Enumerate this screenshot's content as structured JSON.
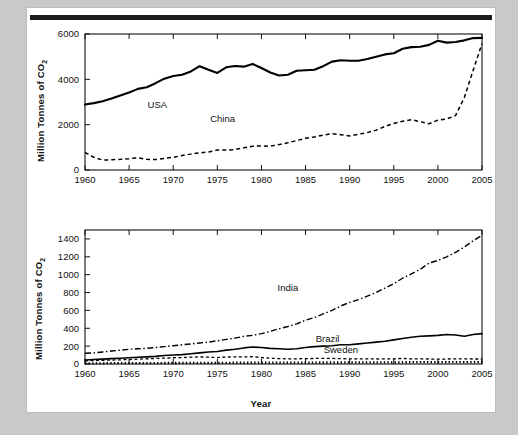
{
  "page": {
    "background_color": "#c9c9c9",
    "sheet_color": "#ffffff",
    "rule_color": "#1c1c1c"
  },
  "chart_data": [
    {
      "id": "top",
      "type": "line",
      "title": "",
      "xlabel": "",
      "ylabel": "Million Tonnes of CO",
      "ylabel_sub": "2",
      "xlim": [
        1960,
        2005
      ],
      "ylim": [
        0,
        6000
      ],
      "yticks": [
        0,
        2000,
        4000,
        6000
      ],
      "xticks": [
        1960,
        1965,
        1970,
        1975,
        1980,
        1985,
        1990,
        1995,
        2000,
        2005
      ],
      "xticklabels": [
        "1960",
        "1965",
        "1970",
        "1975",
        "1980",
        "1985",
        "1990",
        "1995",
        "2000",
        "2005"
      ],
      "yticklabels": [
        "0",
        "2000",
        "4000",
        "6000"
      ],
      "grid": false,
      "legend": "inline-annotations",
      "x": [
        1960,
        1961,
        1962,
        1963,
        1964,
        1965,
        1966,
        1967,
        1968,
        1969,
        1970,
        1971,
        1972,
        1973,
        1974,
        1975,
        1976,
        1977,
        1978,
        1979,
        1980,
        1981,
        1982,
        1983,
        1984,
        1985,
        1986,
        1987,
        1988,
        1989,
        1990,
        1991,
        1992,
        1993,
        1994,
        1995,
        1996,
        1997,
        1998,
        1999,
        2000,
        2001,
        2002,
        2003,
        2004,
        2005
      ],
      "series": [
        {
          "name": "USA",
          "style": "solid",
          "label_x": 1968.2,
          "label_y": 2720,
          "values": [
            2890,
            2950,
            3030,
            3150,
            3290,
            3420,
            3580,
            3650,
            3830,
            4030,
            4150,
            4200,
            4350,
            4580,
            4420,
            4280,
            4530,
            4590,
            4560,
            4680,
            4500,
            4300,
            4170,
            4200,
            4380,
            4400,
            4420,
            4580,
            4780,
            4840,
            4820,
            4820,
            4900,
            5000,
            5100,
            5150,
            5350,
            5420,
            5440,
            5520,
            5700,
            5620,
            5650,
            5720,
            5820,
            5830
          ]
        },
        {
          "name": "China",
          "style": "dashed",
          "label_x": 1975.6,
          "label_y": 2120,
          "values": [
            780,
            560,
            440,
            450,
            470,
            500,
            540,
            470,
            460,
            510,
            560,
            640,
            700,
            760,
            790,
            880,
            880,
            900,
            980,
            1050,
            1060,
            1050,
            1120,
            1200,
            1300,
            1400,
            1460,
            1540,
            1600,
            1560,
            1500,
            1580,
            1650,
            1760,
            1920,
            2050,
            2150,
            2220,
            2130,
            2040,
            2200,
            2250,
            2400,
            3200,
            4400,
            5580
          ]
        }
      ]
    },
    {
      "id": "bottom",
      "type": "line",
      "title": "",
      "xlabel": "Year",
      "ylabel": "Million Tonnes of CO",
      "ylabel_sub": "2",
      "xlim": [
        1960,
        2005
      ],
      "ylim": [
        0,
        1500
      ],
      "yticks": [
        0,
        200,
        400,
        600,
        800,
        1000,
        1200,
        1400
      ],
      "xticks": [
        1960,
        1965,
        1970,
        1975,
        1980,
        1985,
        1990,
        1995,
        2000,
        2005
      ],
      "xticklabels": [
        "1960",
        "1965",
        "1970",
        "1975",
        "1980",
        "1985",
        "1990",
        "1995",
        "2000",
        "2005"
      ],
      "yticklabels": [
        "0",
        "200",
        "400",
        "600",
        "800",
        "1000",
        "1200",
        "1400"
      ],
      "grid": false,
      "legend": "inline-annotations",
      "x": [
        1960,
        1961,
        1962,
        1963,
        1964,
        1965,
        1966,
        1967,
        1968,
        1969,
        1970,
        1971,
        1972,
        1973,
        1974,
        1975,
        1976,
        1977,
        1978,
        1979,
        1980,
        1981,
        1982,
        1983,
        1984,
        1985,
        1986,
        1987,
        1988,
        1989,
        1990,
        1991,
        1992,
        1993,
        1994,
        1995,
        1996,
        1997,
        1998,
        1999,
        2000,
        2001,
        2002,
        2003,
        2004,
        2005
      ],
      "series": [
        {
          "name": "India",
          "style": "dash-dot",
          "label_x": 1983.0,
          "label_y": 820,
          "values": [
            120,
            125,
            135,
            145,
            155,
            165,
            170,
            175,
            185,
            195,
            205,
            215,
            225,
            235,
            245,
            260,
            275,
            290,
            310,
            320,
            340,
            365,
            395,
            420,
            450,
            490,
            520,
            560,
            600,
            650,
            690,
            720,
            760,
            800,
            850,
            900,
            960,
            1010,
            1060,
            1130,
            1160,
            1200,
            1250,
            1310,
            1380,
            1440
          ]
        },
        {
          "name": "Brazil",
          "style": "solid-thin",
          "label_x": 1987.5,
          "label_y": 245,
          "values": [
            45,
            50,
            55,
            60,
            65,
            70,
            75,
            80,
            85,
            95,
            100,
            105,
            115,
            125,
            135,
            140,
            155,
            165,
            180,
            190,
            185,
            175,
            170,
            165,
            170,
            185,
            195,
            200,
            205,
            215,
            215,
            225,
            235,
            245,
            255,
            270,
            285,
            300,
            310,
            315,
            320,
            330,
            325,
            310,
            330,
            340
          ]
        },
        {
          "name": "Sweden",
          "style": "dashed-thin",
          "label_x": 1989.0,
          "label_y": 120,
          "values": [
            35,
            38,
            41,
            44,
            47,
            50,
            54,
            58,
            62,
            66,
            70,
            72,
            76,
            80,
            76,
            72,
            78,
            80,
            80,
            82,
            72,
            64,
            60,
            58,
            58,
            60,
            62,
            62,
            62,
            60,
            58,
            58,
            58,
            56,
            58,
            58,
            62,
            58,
            58,
            56,
            54,
            56,
            58,
            58,
            56,
            56
          ]
        },
        {
          "name": "baseline-dotted",
          "style": "dotted",
          "label_x": null,
          "label_y": null,
          "values": [
            8,
            8,
            8,
            9,
            9,
            9,
            10,
            10,
            10,
            11,
            11,
            12,
            12,
            12,
            13,
            13,
            13,
            14,
            14,
            14,
            15,
            15,
            15,
            15,
            16,
            16,
            16,
            17,
            17,
            17,
            18,
            18,
            18,
            18,
            19,
            19,
            19,
            20,
            20,
            20,
            21,
            21,
            21,
            22,
            22,
            22
          ]
        }
      ]
    }
  ]
}
